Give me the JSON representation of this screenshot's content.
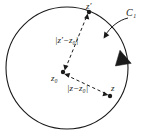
{
  "figure": {
    "type": "complex-plane-circle-diagram",
    "background_color": "#ffffff",
    "stroke_color": "#1a1a1a",
    "labels": {
      "z_prime": "z′",
      "contour": "C₁",
      "dist_zprime_z0": "|z′−z₀|",
      "center": "z₀",
      "dist_z_z0": "|z−z₀|",
      "z": "z"
    },
    "circle": {
      "center_x": 67,
      "center_y": 68,
      "radius": 61,
      "orientation": "counterclockwise"
    },
    "points": [
      {
        "name": "z-prime",
        "x": 89,
        "y": 12
      },
      {
        "name": "z-zero",
        "x": 63,
        "y": 72
      },
      {
        "name": "z",
        "x": 110,
        "y": 96
      }
    ],
    "segments": [
      {
        "name": "z0-to-zprime",
        "style": "dashed",
        "arrows": "both"
      },
      {
        "name": "z0-to-z",
        "style": "dashed",
        "arrows": "both"
      }
    ],
    "annotation_arrow": {
      "name": "contour-pointer",
      "style": "solid-curved",
      "from_label": "C₁",
      "points_to": "circle"
    }
  }
}
